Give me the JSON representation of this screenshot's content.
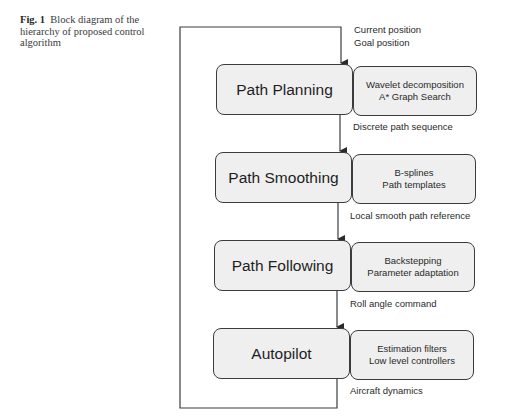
{
  "caption": {
    "prefix": "Fig. 1",
    "text": "Block diagram of the hierarchy of proposed control algorithm"
  },
  "inputs": {
    "line1": "Current position",
    "line2": "Goal position"
  },
  "blocks": [
    {
      "name": "Path Planning",
      "methods": [
        "Wavelet decomposition",
        "A* Graph Search"
      ],
      "output": "Discrete path sequence"
    },
    {
      "name": "Path Smoothing",
      "methods": [
        "B-splines",
        "Path templates"
      ],
      "output": "Local smooth path reference"
    },
    {
      "name": "Path Following",
      "methods": [
        "Backstepping",
        "Parameter adaptation"
      ],
      "output": "Roll angle command"
    },
    {
      "name": "Autopilot",
      "methods": [
        "Estimation filters",
        "Low level controllers"
      ],
      "output": "Aircraft dynamics"
    }
  ],
  "colors": {
    "box_fill": "#efefef",
    "stroke": "#3c3c3c"
  }
}
